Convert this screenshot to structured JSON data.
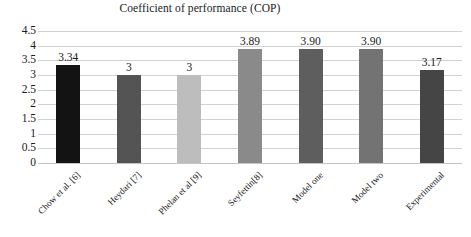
{
  "chart_data": {
    "type": "bar",
    "title": "Coefficient of performance (COP)",
    "xlabel": "",
    "ylabel": "",
    "ylim": [
      0,
      4.5
    ],
    "yticks": [
      "0",
      "0.5",
      "1",
      "1.5",
      "2",
      "2.5",
      "3",
      "3.5",
      "4",
      "4.5"
    ],
    "grid": true,
    "legend": "none",
    "categories": [
      "Chow et al. [6]",
      "Heydari [7]",
      "Phelan et al [9]",
      "Seyfettin[8]",
      "Model one",
      "Model two",
      "Experimental"
    ],
    "values": [
      3.34,
      3,
      3,
      3.89,
      3.9,
      3.9,
      3.17
    ],
    "value_labels": [
      "3.34",
      "3",
      "3",
      "3.89",
      "3.90",
      "3.90",
      "3.17"
    ],
    "bar_colors": [
      "#131313",
      "#545454",
      "#bdbdbd",
      "#8a8a8a",
      "#5e5e5e",
      "#737373",
      "#454545"
    ],
    "grid_color": "#d2d2d2",
    "background": "#ffffff",
    "text_color": "#1a1a1a"
  }
}
